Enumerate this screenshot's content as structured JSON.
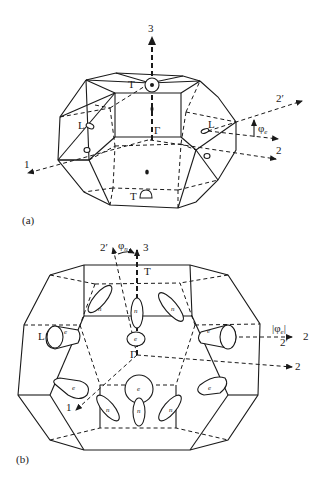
{
  "figure": {
    "panel_a": {
      "label": "(a)",
      "axes": {
        "axis_1": "1",
        "axis_2": "2",
        "axis_2_prime": "2′",
        "axis_3": "3"
      },
      "points": {
        "T_top": "T",
        "T_bottom": "T",
        "Gamma": "Γ",
        "L_left": "L",
        "L_right": "L"
      },
      "angle": "φ",
      "angle_sub": "e"
    },
    "panel_b": {
      "label": "(b)",
      "axes": {
        "axis_1": "1",
        "axis_2_upper": "2",
        "axis_2_lower": "2",
        "axis_2_prime_top": "2′",
        "axis_2_prime_right": "2′",
        "axis_3": "3"
      },
      "points": {
        "T": "T",
        "Gamma": "Γ",
        "L": "L"
      },
      "angle_n": "φ",
      "angle_n_sub": "n",
      "angle_e": "|φ",
      "angle_e_sub": "e",
      "angle_e_close": "|",
      "pockets": {
        "e": "e",
        "n": "n"
      }
    }
  }
}
